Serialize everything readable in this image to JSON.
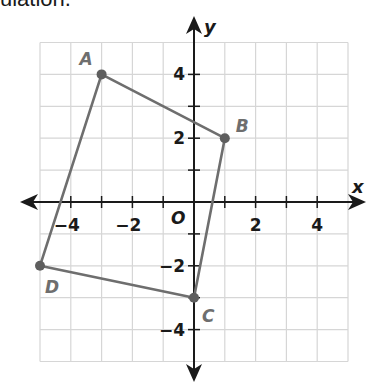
{
  "caption_fragment": "ulation.",
  "colors": {
    "grid": "#d6d6d6",
    "axis": "#1a1a1a",
    "polygon": "#6e6e6e",
    "vertex": "#5e5e5e",
    "vertex_label": "#6e6e6e"
  },
  "axes": {
    "x_label": "x",
    "y_label": "y",
    "origin_label": "O",
    "x_range": [
      -5,
      5
    ],
    "y_range": [
      -5,
      5
    ],
    "x_tick_labels": [
      {
        "value": -4,
        "text": "−4"
      },
      {
        "value": -2,
        "text": "−2"
      },
      {
        "value": 2,
        "text": "2"
      },
      {
        "value": 4,
        "text": "4"
      }
    ],
    "y_tick_labels": [
      {
        "value": 4,
        "text": "4"
      },
      {
        "value": 2,
        "text": "2"
      },
      {
        "value": -2,
        "text": "−2"
      },
      {
        "value": -4,
        "text": "−4"
      }
    ]
  },
  "polygon": {
    "vertices": [
      {
        "label": "A",
        "x": -3,
        "y": 4
      },
      {
        "label": "B",
        "x": 1,
        "y": 2
      },
      {
        "label": "C",
        "x": 0,
        "y": -3
      },
      {
        "label": "D",
        "x": -5,
        "y": -2
      }
    ]
  }
}
